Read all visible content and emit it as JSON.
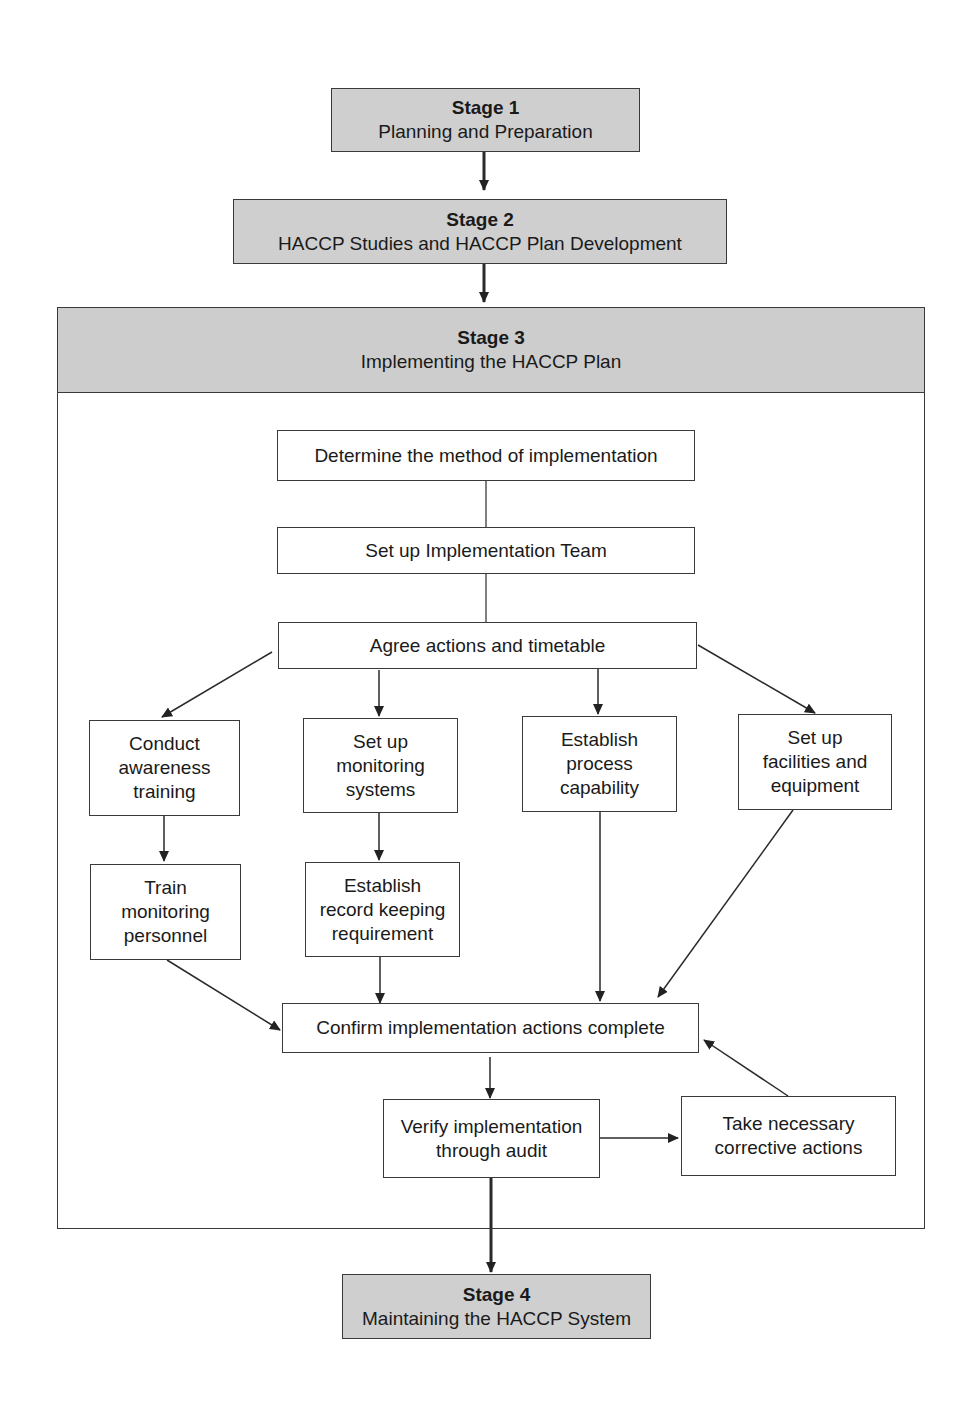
{
  "stages": {
    "s1": {
      "title": "Stage 1",
      "subtitle": "Planning and Preparation"
    },
    "s2": {
      "title": "Stage 2",
      "subtitle": "HACCP Studies and HACCP Plan Development"
    },
    "s3": {
      "title": "Stage 3",
      "subtitle": "Implementing the HACCP Plan"
    },
    "s4": {
      "title": "Stage 4",
      "subtitle": "Maintaining the HACCP System"
    }
  },
  "steps": {
    "determine": "Determine the method of implementation",
    "team": "Set up Implementation Team",
    "agree": "Agree actions and timetable",
    "awareness": [
      "Conduct",
      "awareness",
      "training"
    ],
    "monitoring": [
      "Set up",
      "monitoring",
      "systems"
    ],
    "capability": [
      "Establish",
      "process",
      "capability"
    ],
    "facilities": [
      "Set up",
      "facilities and",
      "equipment"
    ],
    "train": [
      "Train",
      "monitoring",
      "personnel"
    ],
    "records": [
      "Establish",
      "record keeping",
      "requirement"
    ],
    "confirm": "Confirm implementation actions complete",
    "verify": [
      "Verify implementation",
      "through audit"
    ],
    "corrective": [
      "Take necessary",
      "corrective actions"
    ]
  },
  "colors": {
    "stage_fill": "#cfcfcf",
    "line": "#2a2a2a"
  }
}
